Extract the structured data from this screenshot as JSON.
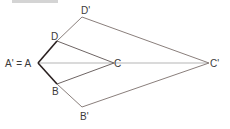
{
  "diagram": {
    "type": "dilation",
    "colors": {
      "original_sides": "#2a2020",
      "image_sides": "#8a7f7c",
      "inner_sides": "#6e6564",
      "axis_line": "#b5b5b5",
      "label": "#3a3a3a"
    },
    "points": {
      "A": {
        "label": "A' = A",
        "x": 38,
        "y": 63
      },
      "D": {
        "label": "D",
        "x": 57,
        "y": 41
      },
      "B": {
        "label": "B",
        "x": 57,
        "y": 84
      },
      "C": {
        "label": "C",
        "x": 114,
        "y": 63
      },
      "Dp": {
        "label": "D'",
        "x": 82,
        "y": 17
      },
      "Bp": {
        "label": "B'",
        "x": 82,
        "y": 107
      },
      "Cp": {
        "label": "C'",
        "x": 209,
        "y": 63
      }
    },
    "segments": [
      {
        "from": "A",
        "to": "D",
        "style": "original"
      },
      {
        "from": "A",
        "to": "B",
        "style": "original"
      },
      {
        "from": "D",
        "to": "C",
        "style": "inner"
      },
      {
        "from": "B",
        "to": "C",
        "style": "inner"
      },
      {
        "from": "D",
        "to": "Dp",
        "style": "image"
      },
      {
        "from": "B",
        "to": "Bp",
        "style": "image"
      },
      {
        "from": "Dp",
        "to": "Cp",
        "style": "image"
      },
      {
        "from": "Bp",
        "to": "Cp",
        "style": "image"
      },
      {
        "from": "A",
        "to": "Cp",
        "style": "axis"
      }
    ]
  }
}
